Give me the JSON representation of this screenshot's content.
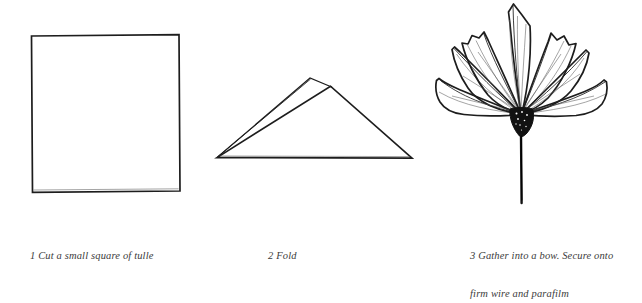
{
  "document": {
    "kind": "craft-instruction-diagram",
    "title": "Tulle bow assembly steps",
    "background_color": "#ffffff",
    "ink_color": "#1d1d1d",
    "caption_color": "#3b3b3b",
    "panel_count": 3
  },
  "steps": [
    {
      "number": "1",
      "caption": "1 Cut a small square of tulle",
      "caption_lines": [
        "1 Cut a small square of tulle"
      ],
      "figure_name": "square-of-tulle",
      "figure_description": "Plain outlined square representing a cut square of tulle fabric"
    },
    {
      "number": "2",
      "caption": "2 Fold",
      "caption_lines": [
        "2 Fold"
      ],
      "figure_name": "folded-triangle",
      "figure_description": "Square folded into a triangle, drawn with two offset apex points showing the layered fold"
    },
    {
      "number": "3",
      "caption": "3 Gather into a bow. Secure onto firm wire and parafilm",
      "caption_lines": [
        "3 Gather into a bow. Secure onto",
        "firm wire and parafilm"
      ],
      "figure_name": "gathered-bow-on-wire",
      "figure_description": "Tulle gathered into a fan-shaped bow with jagged petal tips, radiating fold creases, a dark bound knot at the base and a thin wire stem below"
    }
  ]
}
